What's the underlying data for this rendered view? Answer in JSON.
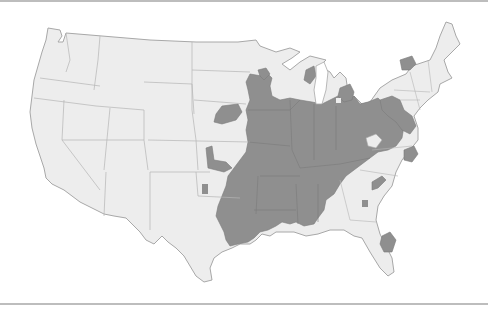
{
  "figure": {
    "type": "choropleth-map",
    "region": "Contiguous United States",
    "legend": null,
    "title": null
  },
  "colors": {
    "background": "#ffffff",
    "rule": "#bdbdbd",
    "land": "#ededed",
    "outline": "#a8a8a8",
    "state_border": "#b5b5b5",
    "shaded": "#8f8f8f",
    "shaded_border": "#7a7a7a"
  },
  "map": {
    "shaded_regions": [
      "Iowa",
      "Missouri",
      "Illinois",
      "Indiana",
      "Ohio",
      "Kentucky",
      "Tennessee",
      "Arkansas",
      "Mississippi",
      "Alabama",
      "West Virginia (partial)",
      "Eastern Oklahoma",
      "Eastern Texas",
      "Louisiana (north)",
      "Southern Minnesota (partial)",
      "Wisconsin (partial)",
      "Michigan (partial)",
      "Pennsylvania (partial)",
      "Maryland/Delaware",
      "Virginia (partial)",
      "Northern New York (partial)",
      "Nebraska (partial)",
      "Kansas (partial)",
      "Georgia (spot)",
      "South Carolina (partial)",
      "Central Florida (partial)"
    ],
    "unshaded_regions": [
      "Washington",
      "Oregon",
      "California",
      "Nevada",
      "Idaho",
      "Montana",
      "Wyoming",
      "Utah",
      "Arizona",
      "Colorado",
      "New Mexico",
      "North Dakota",
      "South Dakota",
      "Western Texas",
      "New England",
      "North Carolina",
      "Georgia",
      "Florida",
      "Southern Louisiana"
    ]
  }
}
